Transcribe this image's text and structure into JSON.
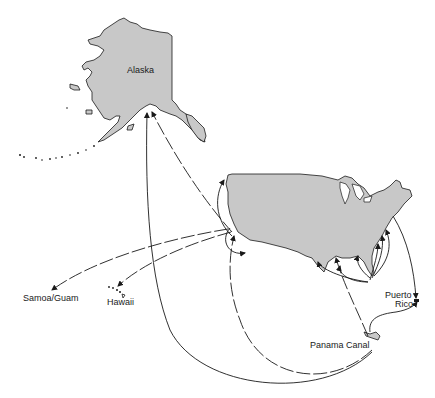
{
  "map": {
    "type": "shipping routes map",
    "colors": {
      "land": "#c8c8c8",
      "outline": "#1a1a1a",
      "background": "#ffffff"
    },
    "labels": {
      "alaska": "Alaska",
      "samoa_guam": "Samoa/Guam",
      "hawaii": "Hawaii",
      "puerto_rico_line1": "Puerto",
      "puerto_rico_line2": "Rico",
      "panama_canal": "Panama Canal"
    },
    "regions": [
      "Alaska",
      "Contiguous United States",
      "Hawaii",
      "Samoa/Guam",
      "Puerto Rico",
      "Panama Canal"
    ],
    "routes": [
      {
        "from": "US West Coast",
        "to": "Alaska",
        "style": "dashed"
      },
      {
        "from": "Panama Canal",
        "to": "Alaska",
        "style": "solid"
      },
      {
        "from": "US West Coast",
        "to": "Samoa/Guam",
        "style": "dashed"
      },
      {
        "from": "US West Coast",
        "to": "Hawaii",
        "style": "dashed"
      },
      {
        "from": "Panama Canal",
        "to": "US West Coast",
        "style": "dashed"
      },
      {
        "from": "Panama Canal",
        "to": "US Gulf Coast",
        "style": "dashed"
      },
      {
        "from": "Panama Canal",
        "to": "US East Coast",
        "style": "solid"
      },
      {
        "from": "US East Coast",
        "to": "Puerto Rico",
        "style": "solid"
      },
      {
        "from": "Panama Canal",
        "to": "Puerto Rico",
        "style": "solid"
      }
    ]
  }
}
